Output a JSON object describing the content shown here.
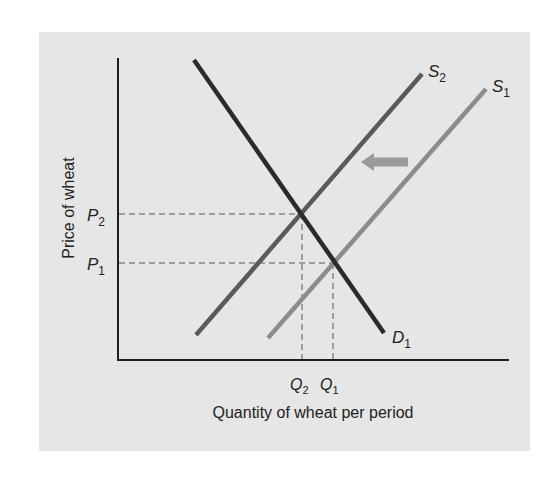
{
  "chart_data": {
    "type": "line",
    "title": "",
    "xlabel": "Quantity of wheat per period",
    "ylabel": "Price of wheat",
    "grid": false,
    "legend": null,
    "series": [
      {
        "name": "D1",
        "label_main": "D",
        "label_sub": "1",
        "kind": "demand",
        "color": "#2b2b2b",
        "points": [
          [
            194,
            60
          ],
          [
            384,
            333
          ]
        ]
      },
      {
        "name": "S2",
        "label_main": "S",
        "label_sub": "2",
        "kind": "supply",
        "color": "#5a5a5a",
        "points": [
          [
            196,
            335
          ],
          [
            422,
            74
          ]
        ]
      },
      {
        "name": "S1",
        "label_main": "S",
        "label_sub": "1",
        "kind": "supply",
        "color": "#8c8c8c",
        "points": [
          [
            268,
            338
          ],
          [
            486,
            89
          ]
        ]
      }
    ],
    "equilibria": [
      {
        "name": "E2",
        "price_label": "P2",
        "quantity_label": "Q2",
        "x": 302,
        "y": 214
      },
      {
        "name": "E1",
        "price_label": "P1",
        "quantity_label": "Q1",
        "x": 333,
        "y": 263
      }
    ],
    "y_ticks": [
      {
        "main": "P",
        "sub": "2",
        "y": 214
      },
      {
        "main": "P",
        "sub": "1",
        "y": 263
      }
    ],
    "x_ticks": [
      {
        "main": "Q",
        "sub": "2",
        "x": 302
      },
      {
        "main": "Q",
        "sub": "1",
        "x": 333
      }
    ],
    "annotations": [
      {
        "type": "arrow",
        "direction": "left",
        "meaning": "supply shifts left from S1 to S2",
        "color": "#9a9a9a"
      }
    ]
  },
  "colors": {
    "panel": "#e6e6e6",
    "axis": "#1e1e1e",
    "dash": "#555555"
  }
}
